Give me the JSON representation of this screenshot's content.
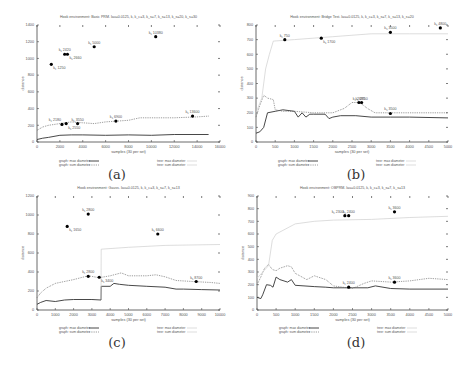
{
  "chart_data": [
    {
      "id": "a",
      "type": "line",
      "caption": "(a)",
      "title": "Hook environment: Basic PRM. lau=0.0125, k, k_c=3, k_s=7, k_s=13, k_s=20, k_s=30",
      "xlabel": "samples (30 per set)",
      "ylabel": "distance",
      "xlim": [
        0,
        16000
      ],
      "ylim": [
        0,
        1400
      ],
      "xticks": [
        0,
        2000,
        4000,
        6000,
        8000,
        10000,
        12000,
        14000,
        16000
      ],
      "yticks": [
        0,
        200,
        400,
        600,
        800,
        1000,
        1200,
        1400
      ],
      "grid": false,
      "legend": {
        "position": "bottom",
        "entries": [
          "graph: max diameter",
          "graph: sum diameter",
          "tree: max diameter",
          "tree: sum diameter"
        ]
      },
      "series": [
        {
          "name": "graph: max diameter",
          "style": "solid",
          "x": [
            0,
            500,
            1000,
            2000,
            3000,
            4000,
            6000,
            8000,
            10000,
            12000,
            15000
          ],
          "values": [
            30,
            45,
            55,
            80,
            85,
            85,
            80,
            85,
            80,
            90,
            90
          ]
        },
        {
          "name": "graph: sum diameter",
          "style": "dotted",
          "x": [
            0,
            500,
            1000,
            2000,
            3000,
            4000,
            5000,
            6000,
            7000,
            8000,
            9000,
            10000,
            12000,
            14000,
            15000
          ],
          "values": [
            140,
            180,
            200,
            220,
            240,
            230,
            220,
            240,
            250,
            260,
            290,
            290,
            290,
            300,
            310
          ]
        },
        {
          "name": "tree: max diameter",
          "style": "light",
          "x": [],
          "values": []
        },
        {
          "name": "tree: sum diameter",
          "style": "light",
          "x": [],
          "values": []
        }
      ],
      "points": [
        {
          "label": "k_c 1250",
          "x": 1250,
          "y": 930,
          "label_pos": "below"
        },
        {
          "label": "k_s 2420",
          "x": 2420,
          "y": 1050,
          "label_pos": "above"
        },
        {
          "label": "k_s 2660",
          "x": 2660,
          "y": 1050,
          "label_pos": "below"
        },
        {
          "label": "k_s 5000",
          "x": 5000,
          "y": 1140,
          "label_pos": "above"
        },
        {
          "label": "k_s 10380",
          "x": 10380,
          "y": 1260,
          "label_pos": "above"
        },
        {
          "label": "k_c 2180",
          "x": 2180,
          "y": 210,
          "label_pos": "above-left"
        },
        {
          "label": "k_s 2550",
          "x": 2550,
          "y": 220,
          "label_pos": "below"
        },
        {
          "label": "k_s 3550",
          "x": 3550,
          "y": 220,
          "label_pos": "above"
        },
        {
          "label": "k_s 6900",
          "x": 6900,
          "y": 250,
          "label_pos": "above"
        },
        {
          "label": "k_s 13600",
          "x": 13600,
          "y": 310,
          "label_pos": "above"
        }
      ]
    },
    {
      "id": "b",
      "type": "line",
      "caption": "(b)",
      "title": "Hook environment: Bridge Test. lau=0.0125, k, k_c=3, k_s=7, k_s=13, k_s=20",
      "xlabel": "samples (30 per set)",
      "ylabel": "distance",
      "xlim": [
        0,
        5000
      ],
      "ylim": [
        0,
        800
      ],
      "xticks": [
        0,
        500,
        1000,
        1500,
        2000,
        2500,
        3000,
        3500,
        4000,
        4500,
        5000
      ],
      "yticks": [
        0,
        100,
        200,
        300,
        400,
        500,
        600,
        700,
        800
      ],
      "grid": false,
      "legend": {
        "position": "bottom",
        "entries": [
          "graph: max diameter",
          "graph: sum diameter",
          "tree: max diameter",
          "tree: sum diameter"
        ]
      },
      "series": [
        {
          "name": "graph: max diameter",
          "style": "solid",
          "x": [
            0,
            100,
            200,
            300,
            500,
            700,
            1000,
            1100,
            1200,
            1300,
            1400,
            1500,
            1800,
            1900,
            2000,
            2200,
            2600,
            3000,
            3500,
            4000,
            5000
          ],
          "values": [
            60,
            70,
            100,
            200,
            210,
            220,
            210,
            170,
            200,
            170,
            190,
            190,
            190,
            160,
            170,
            180,
            180,
            170,
            170,
            170,
            165
          ]
        },
        {
          "name": "graph: sum diameter",
          "style": "dotted",
          "x": [
            0,
            100,
            200,
            300,
            450,
            500,
            700,
            1000,
            1500,
            2000,
            2300,
            2500,
            2700,
            2900,
            3100,
            3500,
            5000
          ],
          "values": [
            170,
            250,
            320,
            300,
            290,
            220,
            210,
            210,
            200,
            200,
            230,
            270,
            270,
            230,
            200,
            200,
            200
          ]
        },
        {
          "name": "tree: max diameter",
          "style": "light",
          "x": [
            0,
            150,
            250,
            350,
            450,
            1000,
            2000,
            3000,
            4000,
            5000
          ],
          "values": [
            200,
            300,
            500,
            600,
            690,
            700,
            720,
            740,
            740,
            740
          ]
        },
        {
          "name": "tree: sum diameter",
          "style": "light",
          "x": [],
          "values": []
        }
      ],
      "points": [
        {
          "label": "k_c 750",
          "x": 750,
          "y": 700,
          "label_pos": "above"
        },
        {
          "label": "k_s 1700",
          "x": 1700,
          "y": 710,
          "label_pos": "below"
        },
        {
          "label": "k_s 3500",
          "x": 3500,
          "y": 750,
          "label_pos": "above"
        },
        {
          "label": "k_s 4800",
          "x": 4800,
          "y": 780,
          "label_pos": "above"
        },
        {
          "label": "k_c 2680",
          "x": 2680,
          "y": 270,
          "label_pos": "above"
        },
        {
          "label": "k_s 2750",
          "x": 2750,
          "y": 270,
          "label_pos": "above"
        },
        {
          "label": "k_s 3500",
          "x": 3500,
          "y": 195,
          "label_pos": "above"
        }
      ]
    },
    {
      "id": "c",
      "type": "line",
      "caption": "(c)",
      "title": "Hook environment: Gauss. lau=0.0125, k, k_c=3, k_s=7, k_s=13",
      "xlabel": "samples (30 per set)",
      "ylabel": "distance",
      "xlim": [
        0,
        10000
      ],
      "ylim": [
        0,
        1200
      ],
      "xticks": [
        0,
        1000,
        2000,
        3000,
        4000,
        5000,
        6000,
        7000,
        8000,
        9000,
        10000
      ],
      "yticks": [
        0,
        200,
        400,
        600,
        800,
        1000,
        1200
      ],
      "grid": false,
      "legend": {
        "position": "bottom",
        "entries": [
          "graph: max diameter",
          "graph: sum diameter",
          "tree: max diameter",
          "tree: sum diameter"
        ]
      },
      "series": [
        {
          "name": "graph: max diameter",
          "style": "solid",
          "x": [
            0,
            200,
            500,
            1000,
            1500,
            2000,
            3000,
            3500,
            3510,
            4000,
            4200,
            4500,
            5000,
            6000,
            7000,
            7600,
            8000,
            9000,
            10000
          ],
          "values": [
            60,
            80,
            100,
            90,
            105,
            110,
            110,
            105,
            250,
            250,
            280,
            270,
            260,
            250,
            240,
            220,
            220,
            215,
            210
          ]
        },
        {
          "name": "graph: sum diameter",
          "style": "dotted",
          "x": [
            0,
            200,
            500,
            1000,
            2000,
            2800,
            3400,
            4000,
            4600,
            5000,
            6000,
            6500,
            7000,
            7600,
            8500,
            9500,
            10000
          ],
          "values": [
            130,
            180,
            230,
            280,
            320,
            360,
            340,
            360,
            390,
            360,
            360,
            370,
            350,
            310,
            300,
            290,
            280
          ]
        },
        {
          "name": "tree: max diameter",
          "style": "light",
          "x": [
            3500,
            3510,
            5000,
            7000,
            10000
          ],
          "values": [
            110,
            640,
            660,
            680,
            690
          ]
        },
        {
          "name": "tree: sum diameter",
          "style": "light",
          "x": [],
          "values": []
        }
      ],
      "points": [
        {
          "label": "k_c 1650",
          "x": 1650,
          "y": 880,
          "label_pos": "below"
        },
        {
          "label": "k_s 2800",
          "x": 2800,
          "y": 1010,
          "label_pos": "above"
        },
        {
          "label": "k_s 6600",
          "x": 6600,
          "y": 800,
          "label_pos": "above"
        },
        {
          "label": "k_c 2800",
          "x": 2800,
          "y": 355,
          "label_pos": "above"
        },
        {
          "label": "k_s 3400",
          "x": 3400,
          "y": 345,
          "label_pos": "below"
        },
        {
          "label": "k_s 8700",
          "x": 8700,
          "y": 300,
          "label_pos": "above"
        }
      ]
    },
    {
      "id": "d",
      "type": "line",
      "caption": "(d)",
      "title": "Hook environment: OBPRM. lau=0.0125, k, k_c=3, k_s=7, k_s=13",
      "xlabel": "samples (30 per set)",
      "ylabel": "distance",
      "xlim": [
        0,
        5000
      ],
      "ylim": [
        0,
        900
      ],
      "xticks": [
        0,
        500,
        1000,
        1500,
        2000,
        2500,
        3000,
        3500,
        4000,
        4500,
        5000
      ],
      "yticks": [
        0,
        100,
        200,
        300,
        400,
        500,
        600,
        700,
        800,
        900
      ],
      "grid": false,
      "legend": {
        "position": "bottom",
        "entries": [
          "graph: max diameter",
          "graph: sum diameter",
          "tree: max diameter",
          "tree: sum diameter"
        ]
      },
      "series": [
        {
          "name": "graph: max diameter",
          "style": "solid",
          "x": [
            0,
            100,
            150,
            250,
            350,
            420,
            500,
            600,
            800,
            900,
            1000,
            1500,
            1800,
            2000,
            2500,
            2900,
            3100,
            3500,
            4000,
            5000
          ],
          "values": [
            100,
            90,
            120,
            200,
            195,
            180,
            260,
            240,
            220,
            240,
            195,
            185,
            180,
            175,
            175,
            175,
            190,
            170,
            165,
            165
          ]
        },
        {
          "name": "graph: sum diameter",
          "style": "dotted",
          "x": [
            0,
            100,
            200,
            300,
            400,
            500,
            600,
            800,
            900,
            1000,
            1300,
            1500,
            1800,
            2000,
            2500,
            2800,
            3000,
            3500,
            4000,
            4500,
            5000
          ],
          "values": [
            200,
            260,
            330,
            360,
            320,
            310,
            330,
            350,
            340,
            290,
            240,
            270,
            240,
            190,
            170,
            210,
            230,
            220,
            230,
            250,
            240
          ]
        },
        {
          "name": "tree: max diameter",
          "style": "light",
          "x": [
            0,
            300,
            400,
            500,
            1000,
            1500,
            2000,
            3000,
            4000,
            5000
          ],
          "values": [
            250,
            350,
            550,
            600,
            680,
            700,
            710,
            715,
            730,
            740
          ]
        },
        {
          "name": "tree: sum diameter",
          "style": "light",
          "x": [],
          "values": []
        }
      ],
      "points": [
        {
          "label": "k_c 2300",
          "x": 2300,
          "y": 745,
          "label_pos": "above-left"
        },
        {
          "label": "k_s 2400",
          "x": 2400,
          "y": 745,
          "label_pos": "above"
        },
        {
          "label": "k_s 3600",
          "x": 3600,
          "y": 775,
          "label_pos": "above"
        },
        {
          "label": "k_c 2400",
          "x": 2400,
          "y": 180,
          "label_pos": "above"
        },
        {
          "label": "k_s 3600",
          "x": 3600,
          "y": 220,
          "label_pos": "above"
        }
      ]
    }
  ],
  "panels": [
    {
      "caption": "(a)"
    },
    {
      "caption": "(b)"
    },
    {
      "caption": "(c)"
    },
    {
      "caption": "(d)"
    }
  ]
}
